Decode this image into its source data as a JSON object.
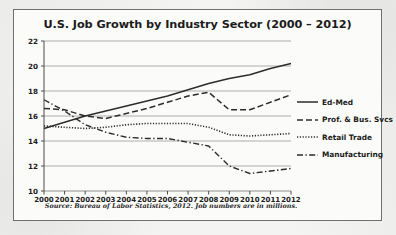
{
  "chart_data": {
    "type": "line",
    "title": "U.S. Job Growth by Industry Sector (2000 – 2012)",
    "xlabel": "",
    "ylabel": "",
    "source_note": "Source: Bureau of Labor Statistics, 2012.  Job numbers are in millions.",
    "grid": true,
    "legend_position": "right",
    "xlim": [
      2000,
      2012
    ],
    "ylim": [
      10,
      22
    ],
    "ytick_step": 2,
    "categories": [
      "2000",
      "2001",
      "2002",
      "2003",
      "2004",
      "2005",
      "2006",
      "2007",
      "2008",
      "2009",
      "2010",
      "2011",
      "2012"
    ],
    "x": [
      2000,
      2001,
      2002,
      2003,
      2004,
      2005,
      2006,
      2007,
      2008,
      2009,
      2010,
      2011,
      2012
    ],
    "yticks": [
      "22",
      "20",
      "18",
      "16",
      "14",
      "12",
      "10"
    ],
    "series": [
      {
        "name": "Ed-Med",
        "style": "solid",
        "color": "#2d2d2d",
        "values": [
          15.0,
          15.5,
          16.0,
          16.4,
          16.8,
          17.2,
          17.6,
          18.1,
          18.6,
          19.0,
          19.3,
          19.8,
          20.2
        ]
      },
      {
        "name": "Prof. & Bus. Svcs",
        "style": "dashed",
        "color": "#2d2d2d",
        "values": [
          16.6,
          16.5,
          16.0,
          15.8,
          16.2,
          16.6,
          17.1,
          17.6,
          17.9,
          16.5,
          16.5,
          17.1,
          17.7
        ]
      },
      {
        "name": "Retail Trade",
        "style": "dotted",
        "color": "#2d2d2d",
        "values": [
          15.2,
          15.1,
          15.0,
          15.1,
          15.3,
          15.4,
          15.4,
          15.4,
          15.1,
          14.5,
          14.4,
          14.5,
          14.6
        ]
      },
      {
        "name": "Manufacturing",
        "style": "dashdot",
        "color": "#2d2d2d",
        "values": [
          17.3,
          16.4,
          15.3,
          14.7,
          14.3,
          14.2,
          14.2,
          13.9,
          13.6,
          12.0,
          11.4,
          11.6,
          11.8
        ]
      }
    ]
  }
}
